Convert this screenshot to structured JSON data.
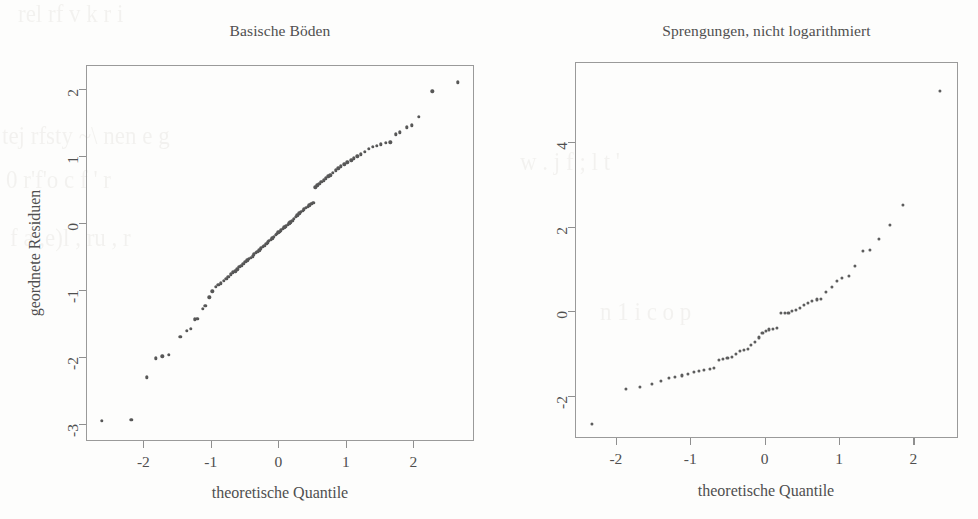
{
  "figure": {
    "background_color": "#fdfdfc",
    "ink_color": "#5d5d5d",
    "axis_color": "#9a9a9a"
  },
  "ghost_text": [
    "rel   rf  v     k    r    i",
    "tej   rfsty  ~\\ nen      e g",
    "0     r'f'o     c f  '  r",
    "f   a  ,e)l  ,    ru   ,      r",
    "w   .  j   f     ;  l  t  '",
    "n    1     i    c   o      p"
  ],
  "chart_data": [
    {
      "type": "scatter",
      "title": "Basische Böden",
      "xlabel": "theoretische Quantile",
      "ylabel": "geordnete Residuen",
      "xlim": [
        -2.85,
        2.9
      ],
      "ylim": [
        -3.25,
        2.35
      ],
      "xticks": [
        -2,
        -1,
        0,
        1,
        2
      ],
      "xticklabels": [
        "-2",
        "-1",
        "0",
        "1",
        "2"
      ],
      "yticks": [
        2,
        1,
        0,
        -1,
        -2,
        -3
      ],
      "yticklabels": [
        "2",
        "1",
        "0",
        "-1",
        "-2",
        "-3"
      ],
      "grid": false,
      "legend": null,
      "points": [
        [
          -2.62,
          -2.95
        ],
        [
          -2.18,
          -2.93
        ],
        [
          -1.95,
          -2.3
        ],
        [
          -1.82,
          -2.02
        ],
        [
          -1.72,
          -1.99
        ],
        [
          -1.62,
          -1.97
        ],
        [
          -1.45,
          -1.7
        ],
        [
          -1.36,
          -1.61
        ],
        [
          -1.3,
          -1.58
        ],
        [
          -1.24,
          -1.44
        ],
        [
          -1.2,
          -1.43
        ],
        [
          -1.12,
          -1.28
        ],
        [
          -1.08,
          -1.24
        ],
        [
          -1.02,
          -1.11
        ],
        [
          -0.98,
          -1.02
        ],
        [
          -0.93,
          -0.95
        ],
        [
          -0.89,
          -0.92
        ],
        [
          -0.85,
          -0.9
        ],
        [
          -0.81,
          -0.86
        ],
        [
          -0.77,
          -0.83
        ],
        [
          -0.74,
          -0.8
        ],
        [
          -0.7,
          -0.77
        ],
        [
          -0.67,
          -0.74
        ],
        [
          -0.64,
          -0.72
        ],
        [
          -0.61,
          -0.69
        ],
        [
          -0.58,
          -0.66
        ],
        [
          -0.55,
          -0.64
        ],
        [
          -0.52,
          -0.61
        ],
        [
          -0.49,
          -0.58
        ],
        [
          -0.46,
          -0.56
        ],
        [
          -0.44,
          -0.54
        ],
        [
          -0.41,
          -0.52
        ],
        [
          -0.38,
          -0.5
        ],
        [
          -0.36,
          -0.47
        ],
        [
          -0.33,
          -0.45
        ],
        [
          -0.31,
          -0.43
        ],
        [
          -0.28,
          -0.41
        ],
        [
          -0.26,
          -0.38
        ],
        [
          -0.23,
          -0.36
        ],
        [
          -0.21,
          -0.34
        ],
        [
          -0.18,
          -0.31
        ],
        [
          -0.16,
          -0.29
        ],
        [
          -0.14,
          -0.27
        ],
        [
          -0.11,
          -0.25
        ],
        [
          -0.09,
          -0.23
        ],
        [
          -0.07,
          -0.21
        ],
        [
          -0.04,
          -0.18
        ],
        [
          -0.02,
          -0.16
        ],
        [
          0.0,
          -0.14
        ],
        [
          0.02,
          -0.13
        ],
        [
          0.04,
          -0.11
        ],
        [
          0.07,
          -0.09
        ],
        [
          0.09,
          -0.07
        ],
        [
          0.11,
          -0.05
        ],
        [
          0.14,
          -0.03
        ],
        [
          0.16,
          -0.01
        ],
        [
          0.18,
          0.01
        ],
        [
          0.21,
          0.03
        ],
        [
          0.23,
          0.06
        ],
        [
          0.26,
          0.09
        ],
        [
          0.28,
          0.11
        ],
        [
          0.31,
          0.14
        ],
        [
          0.33,
          0.16
        ],
        [
          0.36,
          0.18
        ],
        [
          0.38,
          0.2
        ],
        [
          0.41,
          0.22
        ],
        [
          0.44,
          0.24
        ],
        [
          0.46,
          0.26
        ],
        [
          0.49,
          0.28
        ],
        [
          0.52,
          0.3
        ],
        [
          0.55,
          0.53
        ],
        [
          0.58,
          0.56
        ],
        [
          0.61,
          0.58
        ],
        [
          0.64,
          0.61
        ],
        [
          0.67,
          0.63
        ],
        [
          0.7,
          0.66
        ],
        [
          0.74,
          0.69
        ],
        [
          0.77,
          0.71
        ],
        [
          0.81,
          0.74
        ],
        [
          0.85,
          0.78
        ],
        [
          0.89,
          0.81
        ],
        [
          0.93,
          0.84
        ],
        [
          0.98,
          0.87
        ],
        [
          1.02,
          0.9
        ],
        [
          1.08,
          0.93
        ],
        [
          1.12,
          0.96
        ],
        [
          1.17,
          0.99
        ],
        [
          1.22,
          1.02
        ],
        [
          1.28,
          1.06
        ],
        [
          1.34,
          1.1
        ],
        [
          1.4,
          1.13
        ],
        [
          1.46,
          1.15
        ],
        [
          1.52,
          1.17
        ],
        [
          1.59,
          1.19
        ],
        [
          1.66,
          1.2
        ],
        [
          1.74,
          1.32
        ],
        [
          1.8,
          1.35
        ],
        [
          1.9,
          1.42
        ],
        [
          1.98,
          1.45
        ],
        [
          2.08,
          1.58
        ],
        [
          2.28,
          1.96
        ],
        [
          2.66,
          2.09
        ]
      ]
    },
    {
      "type": "scatter",
      "title": "Sprengungen, nicht logarithmiert",
      "xlabel": "theoretische Quantile",
      "ylabel": null,
      "xlim": [
        -2.55,
        2.6
      ],
      "ylim": [
        -3.0,
        5.9
      ],
      "xticks": [
        -2,
        -1,
        0,
        1,
        2
      ],
      "xticklabels": [
        "-2",
        "-1",
        "0",
        "1",
        "2"
      ],
      "yticks": [
        4,
        2,
        0,
        -2
      ],
      "yticklabels": [
        "4",
        "2",
        "0",
        "-2"
      ],
      "grid": false,
      "legend": null,
      "points": [
        [
          -2.32,
          -2.67
        ],
        [
          -1.86,
          -1.83
        ],
        [
          -1.68,
          -1.8
        ],
        [
          -1.52,
          -1.73
        ],
        [
          -1.4,
          -1.64
        ],
        [
          -1.29,
          -1.58
        ],
        [
          -1.2,
          -1.55
        ],
        [
          -1.11,
          -1.52
        ],
        [
          -1.03,
          -1.49
        ],
        [
          -0.95,
          -1.44
        ],
        [
          -0.88,
          -1.41
        ],
        [
          -0.81,
          -1.39
        ],
        [
          -0.74,
          -1.36
        ],
        [
          -0.68,
          -1.34
        ],
        [
          -0.61,
          -1.16
        ],
        [
          -0.56,
          -1.13
        ],
        [
          -0.5,
          -1.11
        ],
        [
          -0.44,
          -1.08
        ],
        [
          -0.39,
          -1.0
        ],
        [
          -0.33,
          -0.95
        ],
        [
          -0.28,
          -0.92
        ],
        [
          -0.23,
          -0.89
        ],
        [
          -0.18,
          -0.79
        ],
        [
          -0.13,
          -0.72
        ],
        [
          -0.08,
          -0.62
        ],
        [
          -0.03,
          -0.52
        ],
        [
          0.02,
          -0.47
        ],
        [
          0.06,
          -0.43
        ],
        [
          0.11,
          -0.41
        ],
        [
          0.16,
          -0.4
        ],
        [
          0.22,
          -0.05
        ],
        [
          0.27,
          -0.04
        ],
        [
          0.32,
          -0.03
        ],
        [
          0.37,
          0.0
        ],
        [
          0.42,
          0.03
        ],
        [
          0.47,
          0.08
        ],
        [
          0.53,
          0.14
        ],
        [
          0.58,
          0.2
        ],
        [
          0.64,
          0.25
        ],
        [
          0.7,
          0.28
        ],
        [
          0.76,
          0.3
        ],
        [
          0.83,
          0.46
        ],
        [
          0.9,
          0.58
        ],
        [
          0.97,
          0.71
        ],
        [
          1.04,
          0.79
        ],
        [
          1.13,
          0.84
        ],
        [
          1.22,
          1.07
        ],
        [
          1.32,
          1.42
        ],
        [
          1.42,
          1.45
        ],
        [
          1.54,
          1.72
        ],
        [
          1.68,
          2.05
        ],
        [
          1.86,
          2.51
        ],
        [
          2.36,
          5.21
        ]
      ]
    }
  ]
}
